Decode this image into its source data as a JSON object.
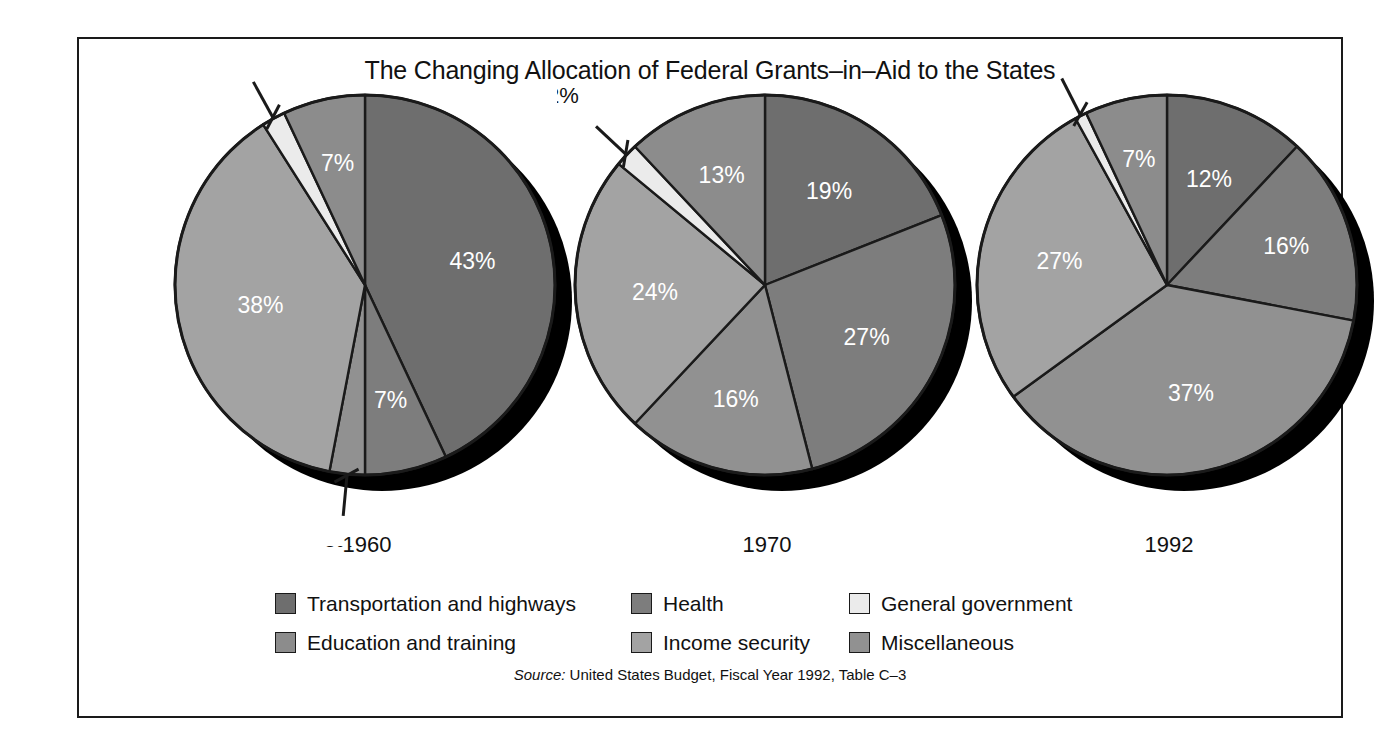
{
  "chart_data": {
    "type": "pie",
    "title": "The Changing Allocation of Federal Grants–in–Aid to the States",
    "source": {
      "prefix": "Source:",
      "text": " United States Budget, Fiscal Year 1992, Table C–3"
    },
    "categories": [
      "Transportation and highways",
      "Health",
      "General government",
      "Education and training",
      "Income security",
      "Miscellaneous"
    ],
    "colors": {
      "transportation_and_highways": "#6e6e6e",
      "health": "#7d7d7d",
      "general_government": "#ebebeb",
      "education_and_training": "#8c8c8c",
      "income_security": "#a3a3a3",
      "miscellaneous": "#919191",
      "outline": "#1a1a1a",
      "shadow": "#000000",
      "label_text": "#ffffff",
      "callout_text": "#111111",
      "background": "#ffffff"
    },
    "legend": {
      "position": "bottom",
      "rows": [
        [
          {
            "label": "Transportation and highways",
            "color": "#6e6e6e"
          },
          {
            "label": "Health",
            "color": "#7d7d7d"
          },
          {
            "label": "General government",
            "color": "#ebebeb"
          }
        ],
        [
          {
            "label": "Education and training",
            "color": "#8c8c8c"
          },
          {
            "label": "Income security",
            "color": "#a3a3a3"
          },
          {
            "label": "Miscellaneous",
            "color": "#919191"
          }
        ]
      ]
    },
    "pies": [
      {
        "year": "1960",
        "cx": 208,
        "cy": 208,
        "r": 190,
        "slices": [
          {
            "category": "Transportation and highways",
            "value": 43,
            "label": "43%",
            "color": "#6e6e6e",
            "start": 0,
            "end": 154.8,
            "label_r": 0.58,
            "inside": true
          },
          {
            "category": "Health",
            "value": 7,
            "label": "7%",
            "color": "#7d7d7d",
            "start": 154.8,
            "end": 180.0,
            "label_r": 0.62,
            "inside": true
          },
          {
            "category": "Miscellaneous",
            "value": 3,
            "label": "3%",
            "color": "#919191",
            "start": 180.0,
            "end": 190.8,
            "label_r": 1.42,
            "inside": false,
            "leader": true
          },
          {
            "category": "Income security",
            "value": 38,
            "label": "38%",
            "color": "#a3a3a3",
            "start": 190.8,
            "end": 327.6,
            "label_r": 0.56,
            "inside": true
          },
          {
            "category": "General government",
            "value": 2,
            "label": "2%",
            "color": "#ebebeb",
            "start": 327.6,
            "end": 334.8,
            "label_r": 1.44,
            "inside": false,
            "leader": true
          },
          {
            "category": "Education and training",
            "value": 7,
            "label": "7%",
            "color": "#8c8c8c",
            "start": 334.8,
            "end": 360.0,
            "label_r": 0.66,
            "inside": true
          }
        ]
      },
      {
        "year": "1970",
        "cx": 208,
        "cy": 208,
        "r": 190,
        "slices": [
          {
            "category": "Transportation and highways",
            "value": 19,
            "label": "19%",
            "color": "#6e6e6e",
            "start": 0,
            "end": 68.4,
            "label_r": 0.6,
            "inside": true
          },
          {
            "category": "Health",
            "value": 27,
            "label": "27%",
            "color": "#7d7d7d",
            "start": 68.4,
            "end": 165.6,
            "label_r": 0.6,
            "inside": true
          },
          {
            "category": "Miscellaneous",
            "value": 16,
            "label": "16%",
            "color": "#919191",
            "start": 165.6,
            "end": 223.2,
            "label_r": 0.62,
            "inside": true
          },
          {
            "category": "Income security",
            "value": 24,
            "label": "24%",
            "color": "#a3a3a3",
            "start": 223.2,
            "end": 309.6,
            "label_r": 0.58,
            "inside": true
          },
          {
            "category": "General government",
            "value": 2,
            "label": "2%",
            "color": "#ebebeb",
            "start": 309.6,
            "end": 316.8,
            "label_r": 1.46,
            "inside": false,
            "leader": true
          },
          {
            "category": "Education and training",
            "value": 13,
            "label": "13%",
            "color": "#8c8c8c",
            "start": 316.8,
            "end": 360.0,
            "label_r": 0.62,
            "inside": true
          }
        ]
      },
      {
        "year": "1992",
        "cx": 208,
        "cy": 208,
        "r": 190,
        "slices": [
          {
            "category": "Transportation and highways",
            "value": 12,
            "label": "12%",
            "color": "#6e6e6e",
            "start": 0,
            "end": 43.2,
            "label_r": 0.6,
            "inside": true
          },
          {
            "category": "Health",
            "value": 16,
            "label": "16%",
            "color": "#7d7d7d",
            "start": 43.2,
            "end": 100.8,
            "label_r": 0.66,
            "inside": true
          },
          {
            "category": "Miscellaneous",
            "value": 37,
            "label": "37%",
            "color": "#919191",
            "start": 100.8,
            "end": 234.0,
            "label_r": 0.58,
            "inside": true
          },
          {
            "category": "Income security",
            "value": 27,
            "label": "27%",
            "color": "#a3a3a3",
            "start": 234.0,
            "end": 331.2,
            "label_r": 0.58,
            "inside": true
          },
          {
            "category": "General government",
            "value": 1,
            "label": "1%",
            "color": "#ebebeb",
            "start": 331.2,
            "end": 334.8,
            "label_r": 1.4,
            "inside": false,
            "leader": true
          },
          {
            "category": "Education and training",
            "value": 7,
            "label": "7%",
            "color": "#8c8c8c",
            "start": 334.8,
            "end": 360.0,
            "label_r": 0.68,
            "inside": true
          }
        ]
      }
    ],
    "pie_x_positions": [
      78,
      478,
      880
    ],
    "total": 100,
    "units": "percent"
  }
}
